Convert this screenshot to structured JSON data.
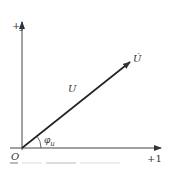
{
  "diagram": {
    "type": "phasor-diagram",
    "axes": {
      "imaginary_label": "+j",
      "real_label": "+1",
      "origin_label": "O"
    },
    "phasor": {
      "symbol_label": "U̇",
      "magnitude_label": "U",
      "angle_label": "φ",
      "angle_subscript": "u"
    },
    "colors": {
      "line": "#333333",
      "background": "#ffffff"
    }
  }
}
